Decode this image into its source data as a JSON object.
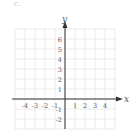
{
  "figure": {
    "part_label": "c.",
    "x_axis_label": "x",
    "y_axis_label": "y",
    "x_tick_labels": [
      "-4",
      "-3",
      "-2",
      "-1",
      "1",
      "2",
      "3",
      "4"
    ],
    "x_tick_values": [
      -4,
      -3,
      -2,
      -1,
      1,
      2,
      3,
      4
    ],
    "y_tick_labels": [
      "6",
      "5",
      "4",
      "3",
      "2",
      "1",
      "-1",
      "-2"
    ],
    "y_tick_values": [
      6,
      5,
      4,
      3,
      2,
      1,
      -1,
      -2
    ],
    "grid": {
      "x_min": -5,
      "x_max": 5,
      "y_min": -3,
      "y_max": 7,
      "color": "#e6e6e6"
    },
    "axis_color": "#333333",
    "label_color": "#555555"
  }
}
